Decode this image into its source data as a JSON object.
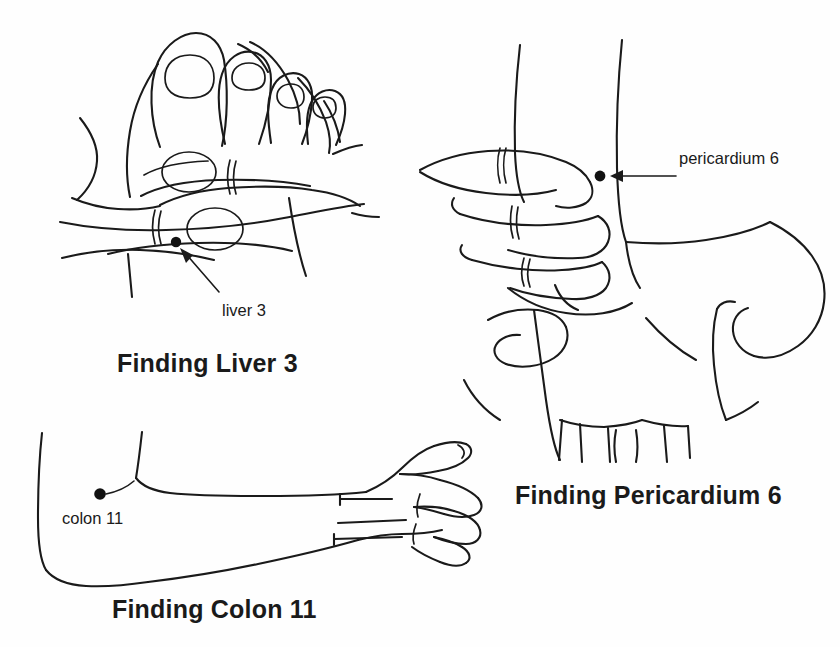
{
  "page": {
    "background_color": "#fefefe",
    "ink_color": "#1a1a1a"
  },
  "figures": [
    {
      "id": "liver-3",
      "caption": "Finding Liver 3",
      "point_label": "liver 3",
      "point_name": "liver 3",
      "subject": "foot with hand locating point between first and second toe",
      "dot": {
        "x": 176,
        "y": 242
      },
      "label_position": {
        "x": 222,
        "y": 301
      },
      "caption_position": {
        "x": 117,
        "y": 349
      }
    },
    {
      "id": "pericardium-6",
      "caption": "Finding Pericardium 6",
      "point_label": "pericardium 6",
      "point_name": "pericardium 6",
      "subject": "hand with three fingers measuring from wrist crease on inner forearm",
      "dot": {
        "x": 600,
        "y": 176
      },
      "label_position": {
        "x": 679,
        "y": 149
      },
      "caption_position": {
        "x": 515,
        "y": 481
      }
    },
    {
      "id": "colon-11",
      "caption": "Finding Colon 11",
      "point_label": "colon 11",
      "point_name": "colon 11",
      "subject": "outstretched arm with point at the outer end of the elbow crease",
      "dot": {
        "x": 100,
        "y": 494
      },
      "label_position": {
        "x": 62,
        "y": 509
      },
      "caption_position": {
        "x": 112,
        "y": 595
      }
    }
  ]
}
